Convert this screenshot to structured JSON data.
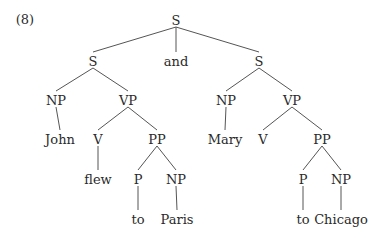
{
  "example_number": "(8)",
  "colors": {
    "text": "#2a2a2a",
    "edge": "#555555",
    "background": "#ffffff"
  },
  "nodes": [
    {
      "id": "s0",
      "label": "S",
      "x": 176,
      "y": 20
    },
    {
      "id": "s1",
      "label": "S",
      "x": 93,
      "y": 61
    },
    {
      "id": "and",
      "label": "and",
      "x": 176,
      "y": 61
    },
    {
      "id": "s2",
      "label": "S",
      "x": 259,
      "y": 61
    },
    {
      "id": "np1",
      "label": "NP",
      "x": 56,
      "y": 100
    },
    {
      "id": "vp1",
      "label": "VP",
      "x": 128,
      "y": 100
    },
    {
      "id": "np2",
      "label": "NP",
      "x": 226,
      "y": 100
    },
    {
      "id": "vp2",
      "label": "VP",
      "x": 292,
      "y": 100
    },
    {
      "id": "john",
      "label": "John",
      "x": 60,
      "y": 139
    },
    {
      "id": "v1",
      "label": "V",
      "x": 98,
      "y": 139
    },
    {
      "id": "pp1",
      "label": "PP",
      "x": 157,
      "y": 139
    },
    {
      "id": "mary",
      "label": "Mary",
      "x": 225,
      "y": 139
    },
    {
      "id": "v2",
      "label": "V",
      "x": 263,
      "y": 139
    },
    {
      "id": "pp2",
      "label": "PP",
      "x": 322,
      "y": 139
    },
    {
      "id": "flew",
      "label": "flew",
      "x": 98,
      "y": 179
    },
    {
      "id": "p1",
      "label": "P",
      "x": 138,
      "y": 179
    },
    {
      "id": "np3",
      "label": "NP",
      "x": 176,
      "y": 179
    },
    {
      "id": "p2",
      "label": "P",
      "x": 303,
      "y": 179
    },
    {
      "id": "np4",
      "label": "NP",
      "x": 341,
      "y": 179
    },
    {
      "id": "to1",
      "label": "to",
      "x": 138,
      "y": 219
    },
    {
      "id": "paris",
      "label": "Paris",
      "x": 177,
      "y": 219
    },
    {
      "id": "to2",
      "label": "to",
      "x": 303,
      "y": 219
    },
    {
      "id": "chicago",
      "label": "Chicago",
      "x": 341,
      "y": 219
    }
  ],
  "edges": [
    [
      "s0",
      "s1"
    ],
    [
      "s0",
      "and"
    ],
    [
      "s0",
      "s2"
    ],
    [
      "s1",
      "np1"
    ],
    [
      "s1",
      "vp1"
    ],
    [
      "s2",
      "np2"
    ],
    [
      "s2",
      "vp2"
    ],
    [
      "np1",
      "john"
    ],
    [
      "vp1",
      "v1"
    ],
    [
      "vp1",
      "pp1"
    ],
    [
      "np2",
      "mary"
    ],
    [
      "vp2",
      "v2"
    ],
    [
      "vp2",
      "pp2"
    ],
    [
      "v1",
      "flew"
    ],
    [
      "pp1",
      "p1"
    ],
    [
      "pp1",
      "np3"
    ],
    [
      "pp2",
      "p2"
    ],
    [
      "pp2",
      "np4"
    ],
    [
      "p1",
      "to1"
    ],
    [
      "np3",
      "paris"
    ],
    [
      "p2",
      "to2"
    ],
    [
      "np4",
      "chicago"
    ]
  ]
}
